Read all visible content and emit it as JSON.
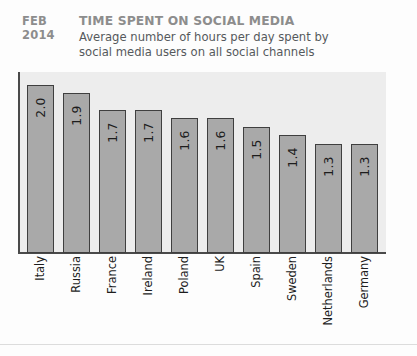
{
  "header": {
    "date_line1": "FEB",
    "date_line2": "2014",
    "title": "TIME SPENT ON SOCIAL MEDIA",
    "subtitle_line1": "Average number of hours per day spent by",
    "subtitle_line2": "social media users on all social channels"
  },
  "colors": {
    "bar_fill": "#a9a9a9",
    "bar_border": "#3f3f3f",
    "plot_background": "#ededed",
    "title_gray": "#8d8d8d",
    "text_dark": "#1d1d1d",
    "page_background": "#fdfdfd"
  },
  "chart_data": {
    "type": "bar",
    "title": "TIME SPENT ON SOCIAL MEDIA",
    "subtitle": "Average number of hours per day spent by social media users on all social channels",
    "xlabel": "",
    "ylabel": "",
    "ylim": [
      0,
      2.15
    ],
    "grid": false,
    "legend": "none",
    "value_label_rotation": -90,
    "category_label_rotation": -90,
    "categories": [
      "Italy",
      "Russia",
      "France",
      "Ireland",
      "Poland",
      "UK",
      "Spain",
      "Sweden",
      "Netherlands",
      "Germany"
    ],
    "values": [
      2.0,
      1.9,
      1.7,
      1.7,
      1.6,
      1.6,
      1.5,
      1.4,
      1.3,
      1.3
    ],
    "value_labels": [
      "2.0",
      "1.9",
      "1.7",
      "1.7",
      "1.6",
      "1.6",
      "1.5",
      "1.4",
      "1.3",
      "1.3"
    ],
    "unit": "hours per day"
  }
}
